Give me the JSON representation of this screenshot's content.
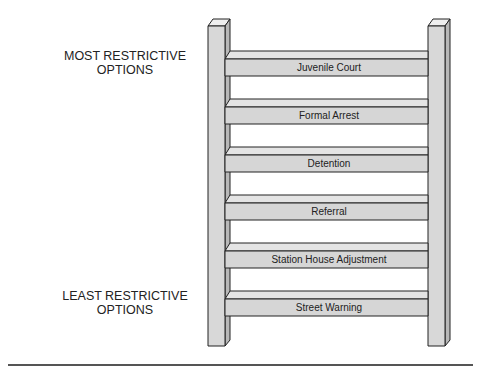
{
  "labels": {
    "top": {
      "line1": "MOST RESTRICTIVE",
      "line2": "OPTIONS"
    },
    "bottom": {
      "line1": "LEAST RESTRICTIVE",
      "line2": "OPTIONS"
    }
  },
  "rungs": [
    {
      "label": "Juvenile Court"
    },
    {
      "label": "Formal Arrest"
    },
    {
      "label": "Detention"
    },
    {
      "label": "Referral"
    },
    {
      "label": "Station House Adjustment"
    },
    {
      "label": "Street Warning"
    }
  ],
  "colors": {
    "post_front": "#d8d8d8",
    "post_side": "#b8b8b8",
    "rung_front": "#d6d6d6",
    "rung_top": "#e4e4e4",
    "outline": "#222222"
  }
}
